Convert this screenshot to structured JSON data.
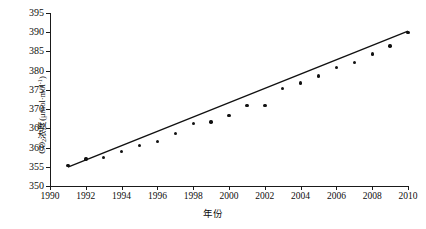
{
  "chart_data": {
    "type": "scatter",
    "title": "",
    "xlabel": "年份",
    "ylabel": "CO2浓度(μmol·mol-1)",
    "ylabel_parts": {
      "pre": "CO",
      "sub": "2",
      "mid": "浓度(μmol·mol",
      "sup": "-1",
      "post": ")"
    },
    "xlim": [
      1990,
      2010
    ],
    "ylim": [
      350,
      395
    ],
    "xticks": [
      1990,
      1992,
      1994,
      1996,
      1998,
      2000,
      2002,
      2004,
      2006,
      2008,
      2010
    ],
    "yticks": [
      350,
      355,
      360,
      365,
      370,
      375,
      380,
      385,
      390,
      395
    ],
    "grid": false,
    "legend": null,
    "marker": "filled-circle",
    "marker_color": "#111111",
    "line_color": "#111111",
    "x": [
      1991,
      1992,
      1993,
      1994,
      1995,
      1996,
      1997,
      1998,
      1999,
      2000,
      2001,
      2002,
      2003,
      2004,
      2005,
      2006,
      2007,
      2008,
      2009,
      2010
    ],
    "values": [
      355.4,
      357.0,
      357.4,
      358.9,
      360.5,
      361.5,
      363.6,
      366.2,
      366.7,
      368.3,
      370.9,
      371.0,
      375.3,
      376.8,
      378.6,
      380.9,
      382.2,
      384.3,
      386.4,
      389.9
    ],
    "trendline": {
      "type": "linear",
      "x_start": 1991,
      "x_end": 2010,
      "y_start": 354.9,
      "y_end": 390.3
    }
  }
}
